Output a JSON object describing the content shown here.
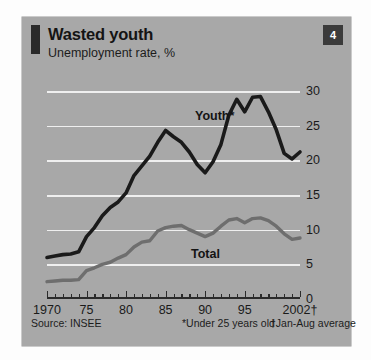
{
  "badge": {
    "number": "4"
  },
  "header": {
    "title": "Wasted youth",
    "subtitle": "Unemployment rate, %"
  },
  "footer": {
    "source": "Source: INSEE",
    "footnote_youth": "*Under 25 years old",
    "footnote_year": "†Jan-Aug average"
  },
  "colors": {
    "panel_background": "#a8a8a8",
    "page_background": "#fdfdfd",
    "gridline": "#efefef",
    "axis": "#2b2b2b",
    "youth_series": "#1a1a1a",
    "total_series": "#6e6e6e",
    "badge_background": "#3b3b3b",
    "badge_text": "#ffffff",
    "text": "#141414"
  },
  "chart_data": {
    "type": "line",
    "title": "Wasted youth",
    "subtitle": "Unemployment rate, %",
    "xlabel": "",
    "ylabel": "Unemployment rate, %",
    "xlim": [
      1970,
      2002
    ],
    "ylim": [
      0,
      30
    ],
    "ytick_values": [
      0,
      5,
      10,
      15,
      20,
      25,
      30
    ],
    "ytick_labels": [
      "0",
      "5",
      "10",
      "15",
      "20",
      "25",
      "30"
    ],
    "xtick_values": [
      1970,
      1975,
      1980,
      1985,
      1990,
      1995,
      2002
    ],
    "xtick_labels": [
      "1970",
      "75",
      "80",
      "85",
      "90",
      "95",
      "2002†"
    ],
    "xtick_minor_step": 1,
    "grid": "horizontal",
    "legend": "inline-labels",
    "x": [
      1970,
      1971,
      1972,
      1973,
      1974,
      1975,
      1976,
      1977,
      1978,
      1979,
      1980,
      1981,
      1982,
      1983,
      1984,
      1985,
      1986,
      1987,
      1988,
      1989,
      1990,
      1991,
      1992,
      1993,
      1994,
      1995,
      1996,
      1997,
      1998,
      1999,
      2000,
      2001,
      2002
    ],
    "series": [
      {
        "name": "Youth",
        "label": "Youth*",
        "note": "Under 25 years old",
        "color": "#1a1a1a",
        "values": [
          6.0,
          6.2,
          6.4,
          6.5,
          6.8,
          9.0,
          10.3,
          12.0,
          13.2,
          14.0,
          15.3,
          17.8,
          19.2,
          20.6,
          22.6,
          24.3,
          23.4,
          22.6,
          21.2,
          19.4,
          18.2,
          19.8,
          22.3,
          26.5,
          28.8,
          27.0,
          29.1,
          29.2,
          27.0,
          24.4,
          21.0,
          20.2,
          21.2
        ]
      },
      {
        "name": "Total",
        "label": "Total",
        "color": "#6e6e6e",
        "values": [
          2.5,
          2.6,
          2.7,
          2.7,
          2.8,
          4.1,
          4.5,
          5.0,
          5.3,
          5.9,
          6.4,
          7.5,
          8.2,
          8.4,
          9.8,
          10.3,
          10.5,
          10.6,
          10.0,
          9.5,
          9.0,
          9.5,
          10.5,
          11.4,
          11.6,
          11.0,
          11.6,
          11.7,
          11.3,
          10.5,
          9.4,
          8.6,
          8.8
        ]
      }
    ]
  }
}
